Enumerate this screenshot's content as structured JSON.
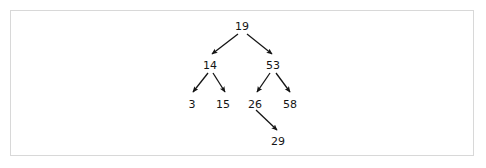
{
  "figure": {
    "kind": "binary-search-tree-diagram",
    "frame": {
      "border_color": "#d8d8d8",
      "background_color": "#ffffff"
    },
    "ink_color": "#141414"
  },
  "tree": {
    "root_value": "19",
    "nodes": [
      {
        "id": "n19",
        "label": "19",
        "x": 242,
        "y": 21,
        "level": 0
      },
      {
        "id": "n14",
        "label": "14",
        "x": 210,
        "y": 60,
        "level": 1
      },
      {
        "id": "n53",
        "label": "53",
        "x": 273,
        "y": 60,
        "level": 1
      },
      {
        "id": "n3",
        "label": "3",
        "x": 192,
        "y": 99,
        "level": 2
      },
      {
        "id": "n15",
        "label": "15",
        "x": 223,
        "y": 99,
        "level": 2
      },
      {
        "id": "n26",
        "label": "26",
        "x": 255,
        "y": 99,
        "level": 2
      },
      {
        "id": "n58",
        "label": "58",
        "x": 290,
        "y": 99,
        "level": 2
      },
      {
        "id": "n29",
        "label": "29",
        "x": 278,
        "y": 136,
        "level": 3
      }
    ],
    "edges": [
      {
        "id": "e19-14",
        "from": "n19",
        "to": "n14",
        "x1": 238,
        "y1": 34,
        "x2": 212,
        "y2": 54
      },
      {
        "id": "e19-53",
        "from": "n19",
        "to": "n53",
        "x1": 247,
        "y1": 34,
        "x2": 272,
        "y2": 54
      },
      {
        "id": "e14-3",
        "from": "n14",
        "to": "n3",
        "x1": 208,
        "y1": 73,
        "x2": 193,
        "y2": 92
      },
      {
        "id": "e14-15",
        "from": "n14",
        "to": "n15",
        "x1": 213,
        "y1": 73,
        "x2": 225,
        "y2": 92
      },
      {
        "id": "e53-26",
        "from": "n53",
        "to": "n26",
        "x1": 270,
        "y1": 73,
        "x2": 257,
        "y2": 92
      },
      {
        "id": "e53-58",
        "from": "n53",
        "to": "n58",
        "x1": 276,
        "y1": 73,
        "x2": 290,
        "y2": 92
      },
      {
        "id": "e26-29",
        "from": "n26",
        "to": "n29",
        "x1": 256,
        "y1": 110,
        "x2": 277,
        "y2": 130
      }
    ]
  }
}
